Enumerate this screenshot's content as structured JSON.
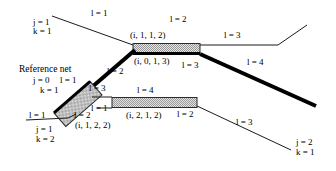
{
  "figure": {
    "type": "network-segment-diagram",
    "background_color": "#ffffff",
    "line_color": "#000000",
    "hatch_fill_color": "#d0d0d0",
    "thick_line_color": "#000000"
  },
  "annotations": {
    "reference_net_title": "Reference net",
    "node_top_left": {
      "j": "j = 1",
      "k": "k = 1"
    },
    "node_reference": {
      "j": "j = 0",
      "k": "k = 1"
    },
    "node_bottom_left": {
      "j": "j = 1",
      "k": "k = 2"
    },
    "node_bottom_right": {
      "j": "j = 2",
      "k": "k = 1"
    }
  },
  "segment_labels": {
    "top_left_l1": "l = 1",
    "top_mid_l2": "l = 2",
    "top_right_l3": "l = 3",
    "ref_l1": "l = 1",
    "diag_l2": "l = 2",
    "bar_top_l3": "l = 3",
    "thick_diag_l4": "l = 4",
    "box_l3": "l = 3",
    "box_l2": "l = 2",
    "box_l1_right": "l = 1",
    "bottom_left_l1": "l = 1",
    "mid_bar_l4": "l = 4",
    "mid_bar_l2": "l = 2",
    "bottom_right_l3": "l = 3"
  },
  "tuple_labels": {
    "top_bar_above": "(i, 1, 1, 2)",
    "top_bar_below": "(i, 0, 1, 3)",
    "rotated_box": "(i, 1, 2, 2)",
    "mid_bar": "(i, 2, 1, 2)"
  },
  "geometry": {
    "top_left_line": "from (52,16) to (133,46)",
    "top_bar": "x 133-200, y 44-54",
    "top_right_line": "from (200,46) to (278,46) to (307,26)",
    "thick_diagonal_upper": "from (133,50) to (72,105)",
    "thick_diagonal_lower": "from (200,52) to (315,105)",
    "rotated_box": "rotated hatched rectangle centered near (78,104)",
    "mid_bar": "x 112-197, y 98-109",
    "bottom_right_line": "from (197,105) to (290,148)",
    "bottom_left_line": "from (28,120) to (70,118)"
  }
}
